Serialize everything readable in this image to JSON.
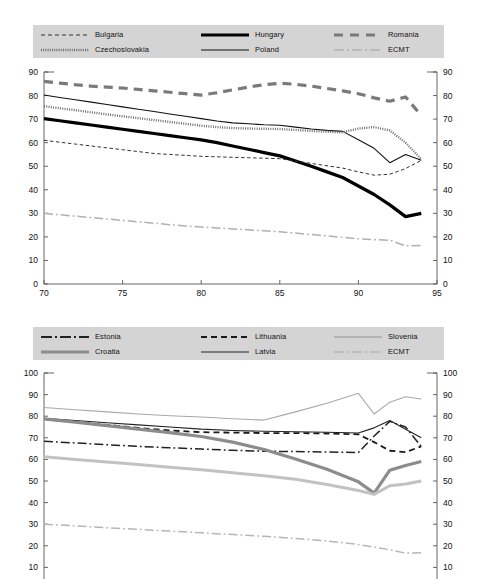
{
  "ghost_header": "",
  "figures": [
    {
      "id": "figure-1",
      "legend": [
        {
          "label": "Bulgaria",
          "style": "dashed-thin-black"
        },
        {
          "label": "Hungary",
          "style": "solid-thick-black"
        },
        {
          "label": "Romania",
          "style": "dashed-thick-gray"
        },
        {
          "label": "Czechoslovakia",
          "style": "dotted-gray"
        },
        {
          "label": "Poland",
          "style": "solid-thin-black"
        },
        {
          "label": "ECMT",
          "style": "dashdot-lightgray"
        }
      ],
      "axes": {
        "x_ticks": [
          70,
          75,
          80,
          85,
          90,
          95
        ],
        "x_min": 70,
        "x_max": 95,
        "y_ticks": [
          0,
          10,
          20,
          30,
          40,
          50,
          60,
          70,
          80,
          90
        ],
        "y_min": 0,
        "y_max": 90,
        "y_axis_right": true,
        "grid": false
      }
    },
    {
      "id": "figure-2",
      "legend": [
        {
          "label": "Estonia",
          "style": "dashdot-black"
        },
        {
          "label": "Lithuania",
          "style": "dashed-black"
        },
        {
          "label": "Slovenia",
          "style": "solid-lightgray"
        },
        {
          "label": "Croatia",
          "style": "solid-thick-gray"
        },
        {
          "label": "Latvia",
          "style": "solid-thin-black"
        },
        {
          "label": "ECMT",
          "style": "dashdot-lightgray"
        }
      ],
      "axes": {
        "x_ticks": [],
        "x_min": 70,
        "x_max": 95,
        "y_ticks": [
          10,
          20,
          30,
          40,
          50,
          60,
          70,
          80,
          90,
          100
        ],
        "y_min": 0,
        "y_max": 100,
        "y_axis_right": true,
        "grid": false,
        "clipped_bottom": true
      }
    }
  ],
  "chart_data": [
    {
      "type": "line",
      "title": "",
      "subtitle": "",
      "xlabel": "",
      "ylabel": "",
      "xlim": [
        70,
        95
      ],
      "ylim": [
        0,
        90
      ],
      "xticks": [
        70,
        75,
        80,
        85,
        90,
        95
      ],
      "yticks": [
        0,
        10,
        20,
        30,
        40,
        50,
        60,
        70,
        80,
        90
      ],
      "grid": false,
      "legend_position": "top",
      "x": [
        70,
        71,
        72,
        73,
        74,
        75,
        76,
        77,
        78,
        79,
        80,
        81,
        82,
        83,
        84,
        85,
        86,
        87,
        88,
        89,
        90,
        91,
        92,
        93,
        94
      ],
      "series": [
        {
          "name": "Romania",
          "color": "#7a7a7a",
          "style": "dashed-thick",
          "values": [
            86.0,
            85.3,
            84.6,
            84.0,
            83.6,
            83.2,
            82.6,
            82.0,
            81.4,
            80.8,
            80.2,
            81.2,
            82.4,
            83.6,
            84.6,
            85.2,
            84.8,
            84.0,
            83.0,
            82.0,
            80.8,
            79.0,
            77.6,
            79.4,
            71.5
          ]
        },
        {
          "name": "Poland",
          "color": "#111111",
          "style": "solid-thin",
          "values": [
            80.2,
            79.2,
            78.2,
            77.2,
            76.2,
            75.2,
            74.2,
            73.2,
            72.2,
            71.2,
            70.2,
            69.2,
            68.4,
            68.0,
            67.6,
            67.4,
            66.6,
            65.8,
            65.2,
            64.8,
            61.2,
            57.6,
            51.5,
            55.0,
            52.5
          ]
        },
        {
          "name": "Czechoslovakia",
          "color": "#6e6e6e",
          "style": "dotted",
          "values": [
            75.5,
            74.6,
            73.8,
            72.9,
            72.0,
            71.2,
            70.4,
            69.6,
            68.8,
            68.0,
            67.2,
            66.6,
            66.2,
            66.0,
            65.9,
            65.8,
            65.4,
            65.0,
            64.6,
            64.4,
            66.0,
            66.6,
            65.2,
            60.0,
            53.0
          ]
        },
        {
          "name": "Hungary",
          "color": "#000000",
          "style": "solid-thick",
          "values": [
            70.2,
            69.3,
            68.4,
            67.5,
            66.6,
            65.7,
            64.8,
            63.9,
            63.0,
            62.1,
            61.2,
            60.0,
            58.6,
            57.2,
            55.8,
            54.4,
            52.2,
            50.0,
            47.6,
            45.2,
            41.6,
            38.0,
            33.6,
            28.6,
            30.0
          ]
        },
        {
          "name": "Bulgaria",
          "color": "#333333",
          "style": "dashed-thin",
          "values": [
            61.0,
            60.2,
            59.4,
            58.6,
            57.8,
            57.0,
            56.2,
            55.4,
            55.0,
            54.6,
            54.2,
            54.0,
            53.8,
            53.6,
            53.4,
            53.2,
            52.2,
            51.2,
            50.2,
            49.2,
            47.6,
            46.2,
            46.6,
            49.0,
            52.5
          ]
        },
        {
          "name": "ECMT",
          "color": "#b0b0b0",
          "style": "dashdot",
          "values": [
            30.0,
            29.4,
            28.8,
            28.2,
            27.6,
            27.0,
            26.4,
            25.8,
            25.2,
            24.6,
            24.2,
            23.8,
            23.4,
            23.0,
            22.6,
            22.2,
            21.6,
            21.0,
            20.4,
            19.8,
            19.2,
            18.8,
            18.6,
            16.2,
            16.4
          ]
        }
      ]
    },
    {
      "type": "line",
      "title": "",
      "subtitle": "",
      "xlabel": "",
      "ylabel": "",
      "xlim": [
        70,
        95
      ],
      "ylim": [
        0,
        100
      ],
      "xticks": [],
      "yticks": [
        10,
        20,
        30,
        40,
        50,
        60,
        70,
        80,
        90,
        100
      ],
      "grid": false,
      "legend_position": "top",
      "x": [
        70,
        72,
        74,
        76,
        78,
        80,
        82,
        84,
        86,
        88,
        90,
        91,
        92,
        93,
        94
      ],
      "series": [
        {
          "name": "Slovenia",
          "color": "#a8a8a8",
          "style": "solid-thin",
          "values": [
            84.0,
            83.0,
            82.0,
            81.0,
            80.2,
            79.6,
            78.8,
            78.2,
            82.0,
            86.0,
            90.6,
            81.0,
            86.5,
            89.0,
            88.0
          ]
        },
        {
          "name": "Latvia",
          "color": "#222222",
          "style": "solid-thin",
          "values": [
            79.0,
            78.0,
            77.0,
            76.0,
            75.0,
            74.0,
            73.4,
            73.0,
            72.8,
            72.6,
            72.2,
            74.6,
            78.0,
            74.0,
            70.0
          ]
        },
        {
          "name": "Lithuania",
          "color": "#1a1a1a",
          "style": "dashed",
          "values": [
            78.6,
            77.4,
            76.0,
            74.6,
            73.4,
            72.6,
            72.4,
            72.2,
            72.2,
            72.0,
            71.6,
            68.0,
            64.0,
            63.4,
            66.0
          ]
        },
        {
          "name": "Estonia",
          "color": "#222222",
          "style": "dashdot",
          "values": [
            68.4,
            67.6,
            66.8,
            66.0,
            65.4,
            64.8,
            64.2,
            63.8,
            63.6,
            63.4,
            63.2,
            70.8,
            77.6,
            75.0,
            66.0
          ]
        },
        {
          "name": "Croatia",
          "color": "#8c8c8c",
          "style": "solid-thick",
          "values": [
            78.8,
            77.2,
            75.6,
            74.0,
            72.4,
            70.6,
            68.0,
            64.6,
            60.2,
            55.4,
            49.6,
            44.4,
            55.0,
            57.2,
            59.0
          ]
        },
        {
          "name": "ECMT-2",
          "color": "#c2c2c2",
          "style": "solid-thick-light",
          "values": [
            61.2,
            60.0,
            58.8,
            57.6,
            56.4,
            55.2,
            53.8,
            52.4,
            50.8,
            48.4,
            45.6,
            43.8,
            47.8,
            48.6,
            50.0
          ]
        },
        {
          "name": "ECMT",
          "color": "#b6b6b6",
          "style": "dashdot",
          "values": [
            30.0,
            29.2,
            28.4,
            27.6,
            26.8,
            26.0,
            25.2,
            24.4,
            23.4,
            22.2,
            20.6,
            19.4,
            18.2,
            16.6,
            16.8
          ]
        }
      ]
    }
  ]
}
